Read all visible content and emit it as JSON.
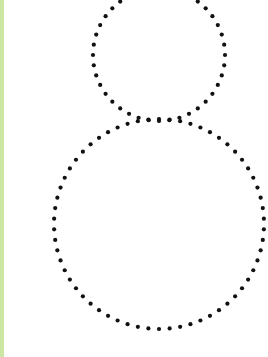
{
  "figure": {
    "width": 268,
    "height": 357,
    "background": "#ffffff",
    "left_strip_color": "#cde6a3",
    "dot_color": "#111111",
    "dot_radius": 2.1,
    "shapes": [
      {
        "name": "top-dotted-circle",
        "cx": 159,
        "cy": 55,
        "r": 66,
        "dots": 40
      },
      {
        "name": "bottom-dotted-circle",
        "cx": 159,
        "cy": 224,
        "r": 105,
        "dots": 62
      }
    ]
  }
}
